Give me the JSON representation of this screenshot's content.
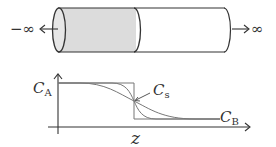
{
  "cylinder": {
    "left_label": "−∞",
    "right_label": "∞",
    "shaded_color": "#dcdcdc",
    "stroke_color": "#333333"
  },
  "graph": {
    "y_label_top": "C",
    "y_label_top_sub": "A",
    "x_label": "z",
    "curve_label": "C",
    "curve_label_sub": "s",
    "right_label": "C",
    "right_label_sub": "B",
    "curve_color": "#666666"
  }
}
